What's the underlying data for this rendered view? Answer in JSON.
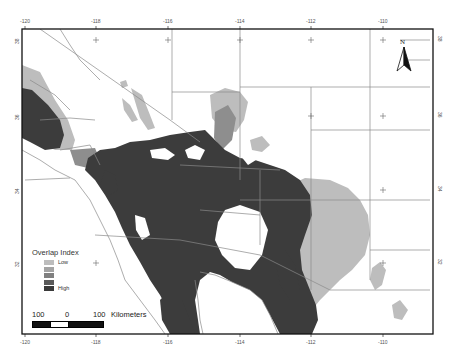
{
  "map": {
    "frame": {
      "left": 22,
      "top": 29,
      "right": 433,
      "bottom": 334
    },
    "longitude_ticks": [
      {
        "label": "-120",
        "x": 25
      },
      {
        "label": "-118",
        "x": 96
      },
      {
        "label": "-116",
        "x": 168
      },
      {
        "label": "-114",
        "x": 240
      },
      {
        "label": "-112",
        "x": 311
      },
      {
        "label": "-110",
        "x": 383
      }
    ],
    "latitude_ticks": [
      {
        "label": "38",
        "y": 40
      },
      {
        "label": "36",
        "y": 116
      },
      {
        "label": "34",
        "y": 190
      },
      {
        "label": "32",
        "y": 263
      }
    ],
    "colors": {
      "frame": "#111111",
      "boundary": "#8a8a8a",
      "class1_low": "#bdbdbd",
      "class2": "#a3a3a3",
      "class3": "#808080",
      "class4": "#5a5a5a",
      "class5_high": "#3a3a3a"
    }
  },
  "legend": {
    "title": "Overlap Index",
    "items": [
      {
        "label": "Low",
        "color": "#bdbdbd"
      },
      {
        "label": "",
        "color": "#a3a3a3"
      },
      {
        "label": "",
        "color": "#808080"
      },
      {
        "label": "",
        "color": "#5a5a5a"
      },
      {
        "label": "High",
        "color": "#3a3a3a"
      }
    ]
  },
  "scale_bar": {
    "labels": [
      "100",
      "0",
      "100"
    ],
    "unit": "Kilometers"
  },
  "north_arrow": {
    "label": "N"
  }
}
